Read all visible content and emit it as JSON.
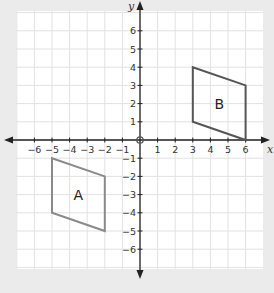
{
  "diagram": {
    "type": "coordinate-plane",
    "axes": {
      "x_label": "x",
      "y_label": "y",
      "x_ticks": [
        "-6",
        "-5",
        "-4",
        "-3",
        "-2",
        "-1",
        "1",
        "2",
        "3",
        "4",
        "5",
        "6"
      ],
      "y_ticks": [
        "6",
        "5",
        "4",
        "3",
        "2",
        "1",
        "-1",
        "-2",
        "-3",
        "-4",
        "-5",
        "-6"
      ],
      "origin_label": "0",
      "range": {
        "x": [
          -6,
          6
        ],
        "y": [
          -6,
          6
        ]
      }
    },
    "shapes": [
      {
        "label": "A",
        "vertices": [
          [
            -5,
            -1
          ],
          [
            -2,
            -2
          ],
          [
            -2,
            -5
          ],
          [
            -5,
            -4
          ]
        ],
        "stroke": "#8a8a8a"
      },
      {
        "label": "B",
        "vertices": [
          [
            3,
            4
          ],
          [
            6,
            3
          ],
          [
            6,
            0
          ],
          [
            3,
            1
          ]
        ],
        "stroke": "#555555"
      }
    ],
    "colors": {
      "background": "#ebebeb",
      "grid_bg": "#ffffff",
      "grid_line": "#e2e2e2",
      "axis": "#222222"
    }
  }
}
